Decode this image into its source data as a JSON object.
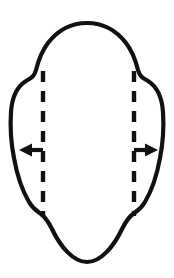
{
  "figure": {
    "title": "Oval outline with two dashed vertical fold lines and outward lateral arrows",
    "background_color": "#ffffff",
    "stroke_color": "#111111",
    "width": 174,
    "height": 278,
    "outline": {
      "name": "oval-outline",
      "top_point_y": 23,
      "bottom_point_y": 262,
      "left_extreme_x": 11,
      "right_extreme_x": 163,
      "stroke_width": 4.2,
      "fill": "#ffffff"
    },
    "dashed_lines": [
      {
        "name": "left-fold-line",
        "x": 43,
        "y_start": 71,
        "y_end": 216,
        "dash_pattern": "11 9",
        "stroke_width": 4.4
      },
      {
        "name": "right-fold-line",
        "x": 134,
        "y_start": 71,
        "y_end": 216,
        "dash_pattern": "11 9",
        "stroke_width": 4.4
      }
    ],
    "arrows": [
      {
        "name": "left-arrow",
        "direction": "left",
        "y": 150,
        "tail_x": 43,
        "tip_x": 19,
        "stroke_width": 4.2
      },
      {
        "name": "right-arrow",
        "direction": "right",
        "y": 150,
        "tail_x": 134,
        "tip_x": 158,
        "stroke_width": 4.2
      }
    ],
    "labels": []
  }
}
